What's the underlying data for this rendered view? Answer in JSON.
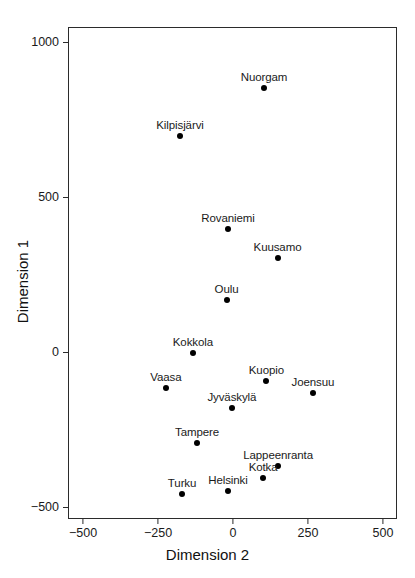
{
  "chart_data": {
    "type": "scatter",
    "title": "",
    "xlabel": "Dimension 2",
    "ylabel": "Dimension 1",
    "xlim": [
      -660,
      550
    ],
    "ylim": [
      -560,
      1080
    ],
    "xticks": [
      -500,
      -250,
      0,
      250,
      500
    ],
    "xticklabels": [
      "-500",
      "-250",
      "0",
      "250",
      "500"
    ],
    "yticks": [
      -500,
      0,
      500,
      1000
    ],
    "yticklabels": [
      "-500",
      "0",
      "500",
      "1000"
    ],
    "grid": false,
    "legend": null,
    "marker": "filled-circle",
    "marker_color": "#000000",
    "points": [
      {
        "label": "Nuorgam",
        "x": 100,
        "y": 855,
        "label_pos": "above"
      },
      {
        "label": "Kilpisjärvi",
        "x": -180,
        "y": 700,
        "label_pos": "above"
      },
      {
        "label": "Rovaniemi",
        "x": -20,
        "y": 400,
        "label_pos": "above"
      },
      {
        "label": "Kuusamo",
        "x": 145,
        "y": 305,
        "label_pos": "above"
      },
      {
        "label": "Oulu",
        "x": -25,
        "y": 170,
        "label_pos": "above"
      },
      {
        "label": "Kokkola",
        "x": -137,
        "y": 0,
        "label_pos": "above"
      },
      {
        "label": "Vaasa",
        "x": -227,
        "y": -113,
        "label_pos": "above"
      },
      {
        "label": "Kuopio",
        "x": 108,
        "y": -90,
        "label_pos": "above"
      },
      {
        "label": "Joensuu",
        "x": 263,
        "y": -129,
        "label_pos": "above"
      },
      {
        "label": "Jyväskylä",
        "x": -7,
        "y": -177,
        "label_pos": "above"
      },
      {
        "label": "Tampere",
        "x": -123,
        "y": -290,
        "label_pos": "above"
      },
      {
        "label": "Lappeenranta",
        "x": 147,
        "y": -365,
        "label_pos": "above"
      },
      {
        "label": "Kotka",
        "x": 97,
        "y": -403,
        "label_pos": "above"
      },
      {
        "label": "Turku",
        "x": -173,
        "y": -455,
        "label_pos": "above"
      },
      {
        "label": "Helsinki",
        "x": -20,
        "y": -445,
        "label_pos": "above"
      }
    ]
  }
}
